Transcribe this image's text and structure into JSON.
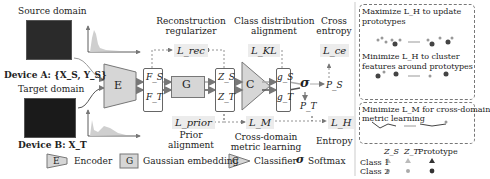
{
  "inputs": {
    "source_label": "Source domain",
    "source_device": "Device A: {X_S, Y_S}",
    "target_label": "Target domain",
    "target_device": "Device B: X_T"
  },
  "blocks": {
    "encoder": "E",
    "features_s": "F_S",
    "features_t": "F_T",
    "gaussian": "G",
    "latent_s": "Z_S",
    "latent_t": "Z_T",
    "classifier": "C",
    "logits_s": "g_S",
    "logits_t": "g_T",
    "softmax": "σ",
    "prob_s": "P_S",
    "prob_t": "P_T"
  },
  "losses": {
    "rec": "L_rec",
    "rec_caption": [
      "Reconstruction",
      "regularizer"
    ],
    "kl": "L_KL",
    "kl_caption": [
      "Class distribution",
      "alignment"
    ],
    "ce": "L_ce",
    "ce_caption": [
      "Cross",
      "entropy"
    ],
    "prior": "L_prior",
    "prior_caption": [
      "Prior",
      "alignment"
    ],
    "metric": "L_M",
    "metric_caption": [
      "Cross-domain",
      "metric learning"
    ],
    "entropy": "L_H",
    "entropy_caption": "Entropy"
  },
  "right_panel": {
    "box1_line1": "Maximize L_H to update",
    "box1_line2": "prototypes",
    "box1_line3": "Minimize L_H to cluster",
    "box1_line4": "features around prototypes",
    "box2_line1": "Minimize L_M for cross-domain",
    "box2_line2": "metric learning",
    "legend_cols": [
      "Z_S",
      "Z_T",
      "Prototype"
    ],
    "legend_rows": [
      "Class 1",
      "Class 2"
    ]
  },
  "legend": {
    "encoder_key": "E",
    "encoder": "Encoder",
    "gaussian_key": "G",
    "gaussian": "Gaussian embedding",
    "classifier_key": "C",
    "classifier": "Classifier",
    "softmax_key": "σ",
    "softmax": "Softmax"
  },
  "colors": {
    "block_fill": "#d6d6d6",
    "loss_bg": "#ececec",
    "line": "#666666"
  }
}
